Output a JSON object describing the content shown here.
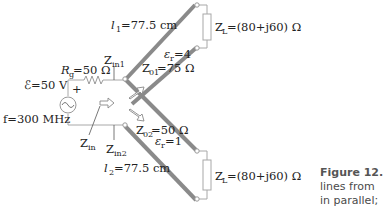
{
  "diagram": {
    "source": {
      "emf_label": "ℰ=50 V",
      "polarity": "+",
      "frequency_label": "f=300 MHz",
      "resistor_label_main": "R",
      "resistor_label_sub": "g",
      "resistor_label_value": "=50 Ω"
    },
    "impedance_labels": {
      "zin": {
        "main": "Z",
        "sub": "in"
      },
      "zin1": {
        "main": "Z",
        "sub": "in1"
      },
      "zin2": {
        "main": "Z",
        "sub": "in2"
      }
    },
    "line1": {
      "length_main": "l",
      "length_sub": "1",
      "length_value": "=77.5 cm",
      "eps_main": "ε",
      "eps_sub": "r",
      "eps_value": "=4",
      "z0_main": "Z",
      "z0_sub": "01",
      "z0_value": "=75 Ω"
    },
    "line2": {
      "length_main": "l",
      "length_sub": "2",
      "length_value": "=77.5 cm",
      "eps_main": "ε",
      "eps_sub": "r",
      "eps_value": "=1",
      "z0_main": "Z",
      "z0_sub": "02",
      "z0_value": "=50 Ω"
    },
    "load1": {
      "main": "Z",
      "sub": "L",
      "value": "=(80+j60) Ω"
    },
    "load2": {
      "main": "Z",
      "sub": "L",
      "value": "=(80+j60) Ω"
    },
    "colors": {
      "line": "#8a8a8a",
      "wire": "#a8a8a8",
      "text": "#222222",
      "caption": "#555555"
    }
  },
  "caption": {
    "line1": "Figure 12.",
    "line2": "lines from",
    "line3": "in parallel;"
  }
}
